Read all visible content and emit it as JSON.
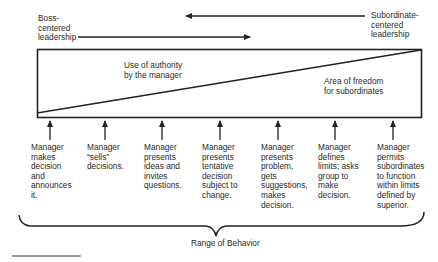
{
  "top_labels": {
    "boss": [
      "Boss-",
      "centered",
      "leadership"
    ],
    "subordinate": [
      "Subordinate-",
      "centered",
      "leadership"
    ]
  },
  "regions": {
    "authority": [
      "Use of authority",
      "by the manager"
    ],
    "freedom": [
      "Area of freedom",
      "for subordinates"
    ]
  },
  "behaviors": [
    {
      "lines": [
        "Manager",
        "makes",
        "decision",
        "and",
        "announces",
        "it."
      ]
    },
    {
      "lines": [
        "Manager",
        "“sells”",
        "decisions."
      ]
    },
    {
      "lines": [
        "Manager",
        "presents",
        "ideas and",
        "invites",
        "questions."
      ]
    },
    {
      "lines": [
        "Manager",
        "presents",
        "tentative",
        "decision",
        "subject to",
        "change."
      ]
    },
    {
      "lines": [
        "Manager",
        "presents",
        "problem,",
        "gets",
        "suggestions,",
        "makes",
        "decision."
      ]
    },
    {
      "lines": [
        "Manager",
        "defines",
        "limits; asks",
        "group to",
        "make",
        "decision."
      ]
    },
    {
      "lines": [
        "Manager",
        "permits",
        "subordinates",
        "to function",
        "within limits",
        "defined by",
        "superior."
      ]
    }
  ],
  "range_label": "Range of Behavior",
  "colors": {
    "ink": "#222222",
    "background": "#ffffff"
  }
}
